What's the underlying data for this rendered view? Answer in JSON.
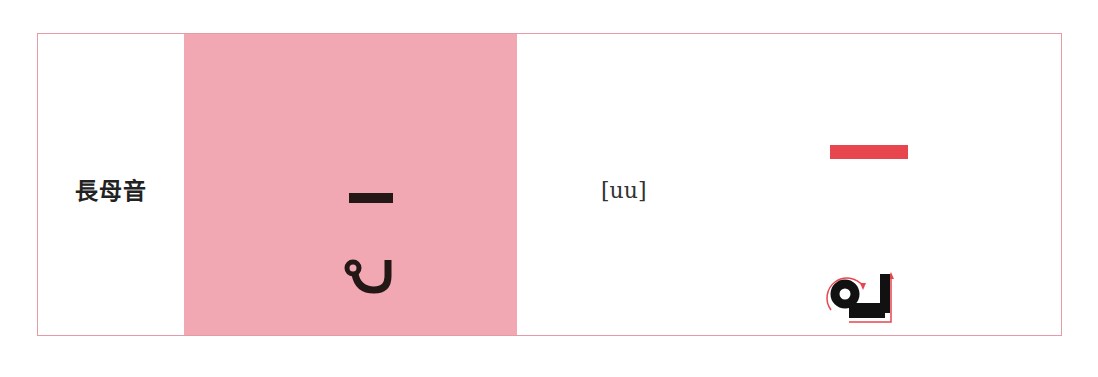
{
  "row": {
    "label": "長母音",
    "letter_glyph": "vowel-sign-uu",
    "pronunciation": "[uu]",
    "stroke_diagram": "stroke-order-uu"
  },
  "colors": {
    "border": "#e69aa5",
    "highlight_column": "#f2a8b2",
    "glyph_black": "#231815",
    "stroke_red": "#e8464f"
  }
}
